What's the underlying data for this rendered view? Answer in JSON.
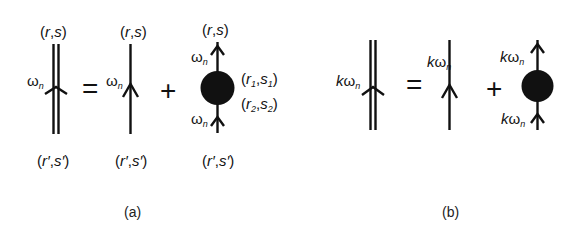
{
  "figure": {
    "panel_a": {
      "caption": "(a)",
      "lhs": {
        "type": "double-line-propagator",
        "top_label": {
          "open": "(",
          "r": "r",
          "comma": ",",
          "s": "s",
          "close": ")"
        },
        "bottom_label": {
          "open": "(",
          "r": "r′",
          "comma": ",",
          "s": "s′",
          "close": ")"
        },
        "freq_label": {
          "omega": "ω",
          "sub": "n"
        }
      },
      "equals": "=",
      "term1": {
        "type": "single-line-propagator",
        "top_label": {
          "open": "(",
          "r": "r",
          "comma": ",",
          "s": "s",
          "close": ")"
        },
        "bottom_label": {
          "open": "(",
          "r": "r′",
          "comma": ",",
          "s": "s′",
          "close": ")"
        },
        "freq_label": {
          "omega": "ω",
          "sub": "n"
        }
      },
      "plus": "+",
      "term2": {
        "type": "blob-vertex",
        "top_label": {
          "open": "(",
          "r": "r",
          "comma": ",",
          "s": "s",
          "close": ")"
        },
        "bottom_label": {
          "open": "(",
          "r": "r′",
          "comma": ",",
          "s": "s′",
          "close": ")"
        },
        "upper_freq": {
          "omega": "ω",
          "sub": "n"
        },
        "lower_freq": {
          "omega": "ω",
          "sub": "n"
        },
        "vertex1": {
          "open": "(",
          "r": "r",
          "rsub": "1",
          "comma": ",",
          "s": "s",
          "ssub": "1",
          "close": ")"
        },
        "vertex2": {
          "open": "(",
          "r": "r",
          "rsub": "2",
          "comma": ",",
          "s": "s",
          "ssub": "2",
          "close": ")"
        }
      }
    },
    "panel_b": {
      "caption": "(b)",
      "lhs": {
        "type": "double-line-propagator",
        "freq_label": {
          "k": "k",
          "omega": "ω",
          "sub": "n"
        }
      },
      "equals": "=",
      "term1": {
        "type": "single-line-propagator",
        "freq_label": {
          "k": "k",
          "omega": "ω",
          "sub": "n"
        }
      },
      "plus": "+",
      "term2": {
        "type": "blob-vertex",
        "upper_freq": {
          "k": "k",
          "omega": "ω",
          "sub": "n"
        },
        "lower_freq": {
          "k": "k",
          "omega": "ω",
          "sub": "n"
        }
      }
    },
    "colors": {
      "ink": "#111111",
      "background": "#ffffff"
    }
  }
}
